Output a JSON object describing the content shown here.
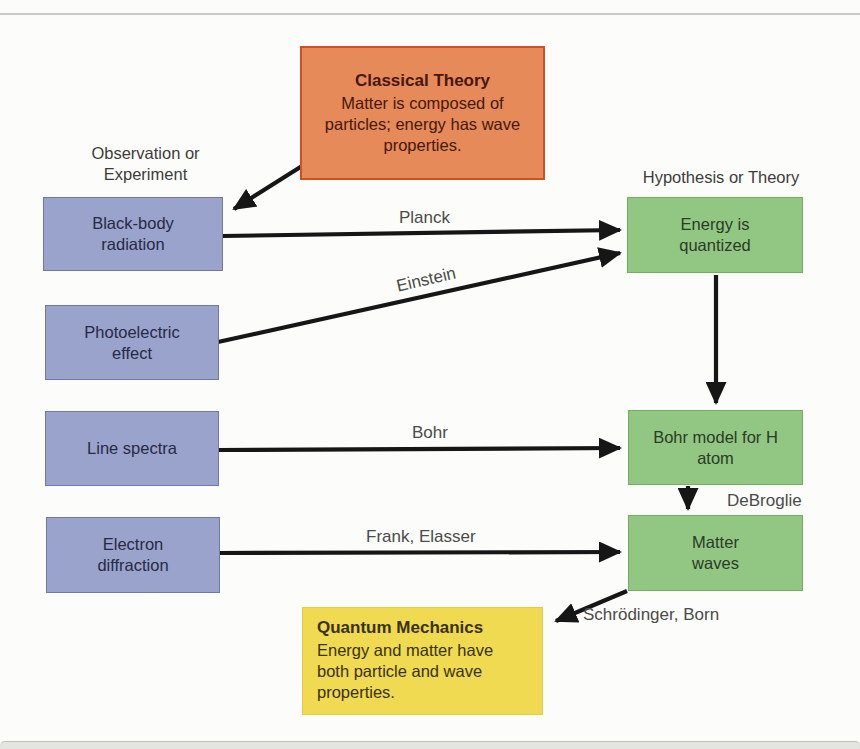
{
  "columns": {
    "left_header": "Observation or Experiment",
    "right_header": "Hypothesis or Theory"
  },
  "classical_theory": {
    "title": "Classical Theory",
    "body": "Matter is composed of particles; energy has wave properties."
  },
  "quantum_mechanics": {
    "title": "Quantum Mechanics",
    "body": "Energy and matter have both particle and wave properties."
  },
  "observations": [
    {
      "label": "Black-body radiation"
    },
    {
      "label": "Photoelectric effect"
    },
    {
      "label": "Line spectra"
    },
    {
      "label": "Electron diffraction"
    }
  ],
  "hypotheses": [
    {
      "label": "Energy is quantized"
    },
    {
      "label": "Bohr model for H atom"
    },
    {
      "label": "Matter waves"
    }
  ],
  "arrow_labels": {
    "planck": "Planck",
    "einstein": "Einstein",
    "bohr": "Bohr",
    "frank_elasser": "Frank, Elasser",
    "debroglie": "DeBroglie",
    "schrodinger_born": "Schrödinger, Born"
  },
  "colors": {
    "observation_fill": "#9aa3cb",
    "observation_border": "#7078a9",
    "hypothesis_fill": "#92c783",
    "hypothesis_border": "#74ad5b",
    "classical_fill": "#e78a59",
    "classical_border": "#d0501f",
    "quantum_fill": "#efda52",
    "quantum_border": "#e6ca40",
    "arrow": "#161616"
  }
}
